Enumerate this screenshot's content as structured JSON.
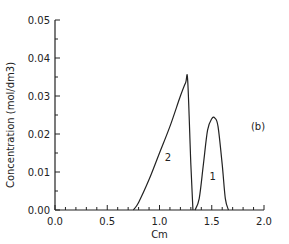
{
  "chart_data": {
    "type": "line",
    "title": "",
    "panel_label": "(b)",
    "xlabel": "Cm",
    "ylabel": "Concentration (mol/dm3)",
    "xlim": [
      0.0,
      2.0
    ],
    "ylim": [
      0.0,
      0.05
    ],
    "x_ticks": [
      "0.0",
      "0.5",
      "1.0",
      "1.5",
      "2.0"
    ],
    "y_ticks": [
      "0.00",
      "0.01",
      "0.02",
      "0.03",
      "0.04",
      "0.05"
    ],
    "grid": false,
    "series": [
      {
        "name": "2",
        "x": [
          0.75,
          0.8,
          0.9,
          1.0,
          1.1,
          1.2,
          1.25,
          1.27,
          1.3,
          1.32
        ],
        "y": [
          0.0,
          0.002,
          0.008,
          0.015,
          0.022,
          0.03,
          0.0335,
          0.034,
          0.012,
          0.0
        ]
      },
      {
        "name": "1",
        "x": [
          1.34,
          1.38,
          1.42,
          1.46,
          1.5,
          1.53,
          1.56,
          1.6,
          1.63,
          1.66
        ],
        "y": [
          0.0,
          0.003,
          0.012,
          0.021,
          0.024,
          0.0242,
          0.022,
          0.012,
          0.003,
          0.0
        ]
      }
    ],
    "curve_labels": [
      {
        "text": "2",
        "x": 1.08,
        "y": 0.013
      },
      {
        "text": "1",
        "x": 1.51,
        "y": 0.008
      }
    ]
  }
}
